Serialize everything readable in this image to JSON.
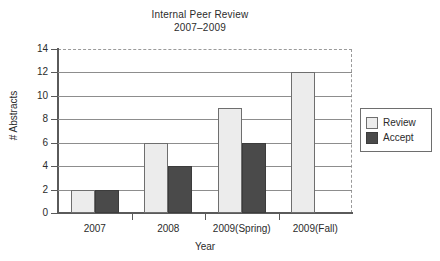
{
  "chart_data": {
    "type": "bar",
    "title": "Internal Peer Review",
    "subtitle": "2007–2009",
    "xlabel": "Year",
    "ylabel": "# Abstracts",
    "categories": [
      "2007",
      "2008",
      "2009(Spring)",
      "2009(Fall)"
    ],
    "series": [
      {
        "name": "Review",
        "values": [
          2,
          6,
          9,
          12
        ],
        "color": "#ececec"
      },
      {
        "name": "Accept",
        "values": [
          2,
          4,
          6,
          0
        ],
        "color": "#4a4a4a"
      }
    ],
    "ylim": [
      0,
      14
    ],
    "ytick_values": [
      0,
      2,
      4,
      6,
      8,
      10,
      12,
      14
    ],
    "ytick_labels": [
      "0",
      "2",
      "4",
      "6",
      "8",
      "10",
      "12",
      "14"
    ],
    "grid": true,
    "grid_axis": "y",
    "legend_position": "right-outside",
    "legend_entries": [
      "Review",
      "Accept"
    ],
    "plot_border": "dashed"
  }
}
